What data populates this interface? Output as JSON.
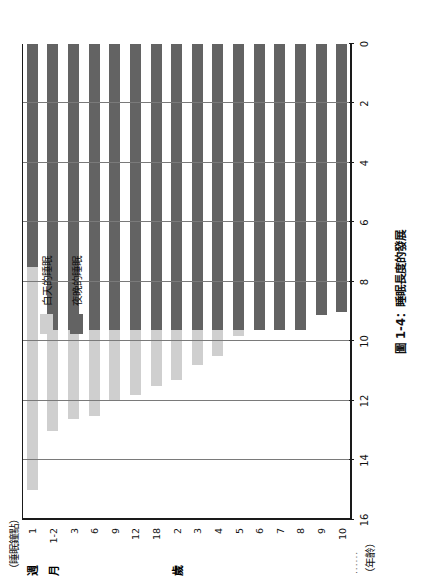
{
  "figure": {
    "caption": "圖 1-4：睡眠長度的發展",
    "value_axis_title": "（睡眠鐘點）",
    "category_axis_title": "（年齡）",
    "rotation": "-90deg"
  },
  "legend": {
    "position": "upper-center",
    "items": [
      {
        "label": "白天的睡眠",
        "color": "#cfcfcf"
      },
      {
        "label": "夜晚的睡眠",
        "color": "#636363"
      }
    ]
  },
  "group_labels": [
    {
      "text": "週",
      "at_category": "1"
    },
    {
      "text": "月",
      "at_category": "1-2"
    },
    {
      "text": "歲",
      "at_category": "2"
    }
  ],
  "chart_data": {
    "type": "bar",
    "orientation": "stacked-horizontal-rotated",
    "title": "圖 1-4：睡眠長度的發展",
    "xlabel": "（年齡）",
    "ylabel": "（睡眠鐘點）",
    "ylim": [
      0,
      16
    ],
    "yticks": [
      0,
      2,
      4,
      6,
      8,
      10,
      12,
      14,
      16
    ],
    "ticklabels": [
      "0",
      "2",
      "4",
      "6",
      "8",
      "10",
      "12",
      "14",
      "16"
    ],
    "grid": true,
    "categories": [
      "1",
      "1-2",
      "3",
      "6",
      "9",
      "12",
      "18",
      "2",
      "3",
      "4",
      "5",
      "6",
      "7",
      "8",
      "9",
      "10"
    ],
    "series": [
      {
        "name": "夜晚的睡眠",
        "color": "#636363",
        "values": [
          7.5,
          9.6,
          9.6,
          9.6,
          9.6,
          9.6,
          9.6,
          9.6,
          9.6,
          9.6,
          9.6,
          9.6,
          9.6,
          9.6,
          9.1,
          9.0
        ]
      },
      {
        "name": "白天的睡眠",
        "color": "#cfcfcf",
        "values": [
          7.5,
          3.4,
          3.0,
          2.9,
          2.4,
          2.2,
          1.9,
          1.7,
          1.2,
          0.9,
          0.2,
          0,
          0,
          0,
          0,
          0
        ]
      }
    ],
    "totals": [
      15.0,
      13.0,
      12.6,
      12.5,
      12.0,
      11.8,
      11.5,
      11.3,
      10.8,
      10.5,
      9.8,
      9.6,
      9.6,
      9.6,
      9.1,
      9.0
    ]
  }
}
